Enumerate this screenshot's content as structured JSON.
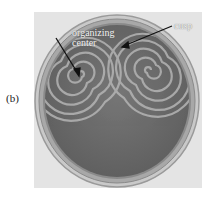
{
  "figure": {
    "panel_label": "(b)",
    "annotations": {
      "organizing_center": "organizing center",
      "organizing_center_line1": "organizing",
      "organizing_center_line2": "center",
      "cusp": "cusp"
    },
    "colors": {
      "background": "#e4e4e4",
      "dish_rim": "#b8b8b8",
      "dish_inner": "#6c6c6c",
      "wave_fronts": "#b0b0b0",
      "arrow": "#111111"
    }
  }
}
